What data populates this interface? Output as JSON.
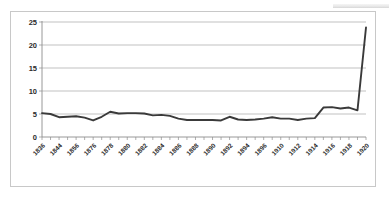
{
  "chart_data": {
    "type": "line",
    "title": "",
    "subtitle": "",
    "xlabel": "",
    "ylabel": "",
    "ylim": [
      0,
      25
    ],
    "yticks": [
      0,
      5,
      10,
      15,
      20,
      25
    ],
    "grid": true,
    "legend": null,
    "legend_position": "none",
    "line_color": "#3a3a3a",
    "gridline_color": "#a6a6a6",
    "plot_background": "#ffffff",
    "border_color": "#c8c8c8",
    "tick_label_rotation": 45,
    "xtick_label_interval": 2,
    "annotations": [],
    "x": [
      1836,
      1840,
      1844,
      1848,
      1856,
      1860,
      1876,
      1877,
      1878,
      1879,
      1880,
      1881,
      1882,
      1883,
      1884,
      1885,
      1886,
      1887,
      1888,
      1889,
      1890,
      1891,
      1892,
      1893,
      1894,
      1895,
      1896,
      1897,
      1910,
      1911,
      1912,
      1913,
      1914,
      1915,
      1916,
      1917,
      1918,
      1919,
      1920
    ],
    "categories": [
      "1836",
      "",
      "1844",
      "",
      "1856",
      "",
      "1876",
      "",
      "1878",
      "",
      "1880",
      "",
      "1882",
      "",
      "1884",
      "",
      "1886",
      "",
      "1888",
      "",
      "1890",
      "",
      "1892",
      "",
      "1894",
      "",
      "1896",
      "",
      "1910",
      "",
      "1912",
      "",
      "1914",
      "",
      "1916",
      "",
      "1918",
      "",
      "1920"
    ],
    "visible_tick_labels": [
      "1836",
      "1844",
      "1856",
      "1876",
      "1878",
      "1880",
      "1882",
      "1884",
      "1886",
      "1888",
      "1890",
      "1892",
      "1894",
      "1896",
      "1910",
      "1912",
      "1914",
      "1916",
      "1918",
      "1920"
    ],
    "values": [
      5.2,
      5.0,
      4.3,
      4.4,
      4.5,
      4.2,
      3.6,
      4.4,
      5.5,
      5.1,
      5.2,
      5.2,
      5.1,
      4.7,
      4.8,
      4.6,
      4.0,
      3.7,
      3.7,
      3.7,
      3.7,
      3.6,
      4.4,
      3.8,
      3.7,
      3.8,
      4.0,
      4.3,
      4.0,
      4.0,
      3.7,
      4.0,
      4.1,
      6.4,
      6.5,
      6.2,
      6.4,
      5.8,
      23.8
    ],
    "series": [
      {
        "name": "series-1",
        "values": [
          5.2,
          5.0,
          4.3,
          4.4,
          4.5,
          4.2,
          3.6,
          4.4,
          5.5,
          5.1,
          5.2,
          5.2,
          5.1,
          4.7,
          4.8,
          4.6,
          4.0,
          3.7,
          3.7,
          3.7,
          3.7,
          3.6,
          4.4,
          3.8,
          3.7,
          3.8,
          4.0,
          4.3,
          4.0,
          4.0,
          3.7,
          4.0,
          4.1,
          6.4,
          6.5,
          6.2,
          6.4,
          5.8,
          23.8
        ]
      }
    ]
  }
}
